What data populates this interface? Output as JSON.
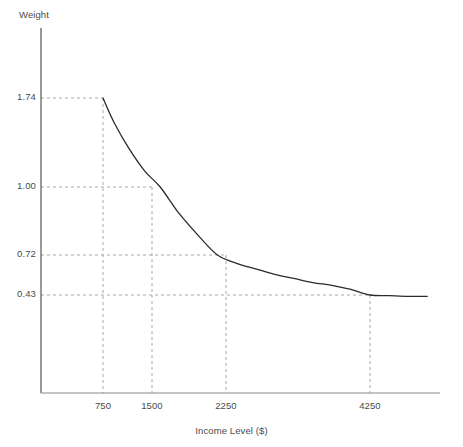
{
  "chart": {
    "title": "",
    "y_axis_label": "Weight",
    "x_axis_label": "Income Level ($)"
  },
  "chart_data": {
    "type": "line",
    "title": "",
    "xlabel": "Income Level ($)",
    "ylabel": "Weight",
    "xlim": [
      0,
      5000
    ],
    "ylim": [
      0,
      2.4
    ],
    "grid": false,
    "legend": null,
    "x_ticks": [
      750,
      1500,
      2250,
      4250
    ],
    "x_tick_labels": [
      "750",
      "1500",
      "2250",
      "4250"
    ],
    "y_ticks": [
      0.43,
      0.72,
      1.0,
      1.74
    ],
    "y_tick_labels": [
      "0.43",
      "0.72",
      "1.00",
      "1.74"
    ],
    "guide_lines": "dashed horizontal and vertical drop lines at each labeled point",
    "series": [
      {
        "name": "weight",
        "x": [
          575,
          750,
          900,
          1100,
          1300,
          1500,
          1750,
          2000,
          2250,
          2500,
          2750,
          3000,
          3250,
          3500,
          3750,
          4000,
          4250,
          4500,
          4750,
          5000
        ],
        "y": [
          2.39,
          1.74,
          1.53,
          1.31,
          1.13,
          1.0,
          0.89,
          0.8,
          0.72,
          0.66,
          0.62,
          0.58,
          0.55,
          0.52,
          0.5,
          0.47,
          0.43,
          0.425,
          0.42,
          0.42
        ]
      }
    ],
    "annotated_points": [
      {
        "x": 750,
        "y": 1.74
      },
      {
        "x": 1500,
        "y": 1.0
      },
      {
        "x": 2250,
        "y": 0.72
      },
      {
        "x": 4250,
        "y": 0.43
      }
    ],
    "colors": {
      "curve": "#2b2b2b",
      "axis": "#6b6b6b",
      "guide": "#a8a8a8",
      "text": "#4a4a4a",
      "background": "#ffffff"
    }
  },
  "y_tick_positions": [
    {
      "label": "1.74",
      "top": 91
    },
    {
      "label": "1.00",
      "top": 180
    },
    {
      "label": "0.72",
      "top": 248
    },
    {
      "label": "0.43",
      "top": 288
    }
  ],
  "x_tick_positions": [
    {
      "label": "750",
      "left": 103
    },
    {
      "label": "1500",
      "left": 152
    },
    {
      "label": "2250",
      "left": 226
    },
    {
      "label": "4250",
      "left": 370
    }
  ]
}
